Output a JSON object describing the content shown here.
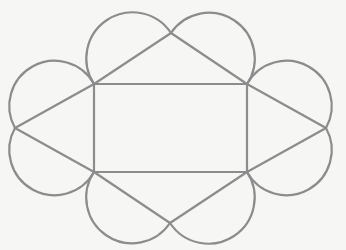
{
  "figure": {
    "background": "#f6f6f5",
    "stroke_color": "#8c8c8c",
    "stroke_width": 2.2
  },
  "rectangle": {
    "corners": {
      "top_left": [
        94,
        84
      ],
      "top_right": [
        247,
        84
      ],
      "bottom_right": [
        247,
        172
      ],
      "bottom_left": [
        94,
        172
      ]
    }
  },
  "triangles": [
    {
      "name": "top",
      "apex": [
        171,
        33
      ],
      "base": [
        "top_left",
        "top_right"
      ]
    },
    {
      "name": "right",
      "apex": [
        326,
        128
      ],
      "base": [
        "top_right",
        "bottom_right"
      ]
    },
    {
      "name": "bottom",
      "apex": [
        170,
        223
      ],
      "base": [
        "bottom_right",
        "bottom_left"
      ]
    },
    {
      "name": "left",
      "apex": [
        15,
        128
      ],
      "base": [
        "bottom_left",
        "top_left"
      ]
    }
  ],
  "semicircles": [
    {
      "name": "top-left",
      "from": [
        94,
        84
      ],
      "to": [
        171,
        33
      ],
      "sweep": 1
    },
    {
      "name": "top-right",
      "from": [
        171,
        33
      ],
      "to": [
        247,
        84
      ],
      "sweep": 1
    },
    {
      "name": "right-top",
      "from": [
        247,
        84
      ],
      "to": [
        326,
        128
      ],
      "sweep": 1
    },
    {
      "name": "right-bottom",
      "from": [
        326,
        128
      ],
      "to": [
        247,
        172
      ],
      "sweep": 1
    },
    {
      "name": "bottom-right",
      "from": [
        247,
        172
      ],
      "to": [
        170,
        223
      ],
      "sweep": 1
    },
    {
      "name": "bottom-left",
      "from": [
        170,
        223
      ],
      "to": [
        94,
        172
      ],
      "sweep": 1
    },
    {
      "name": "left-bottom",
      "from": [
        94,
        172
      ],
      "to": [
        15,
        128
      ],
      "sweep": 1
    },
    {
      "name": "left-top",
      "from": [
        15,
        128
      ],
      "to": [
        94,
        84
      ],
      "sweep": 1
    }
  ]
}
